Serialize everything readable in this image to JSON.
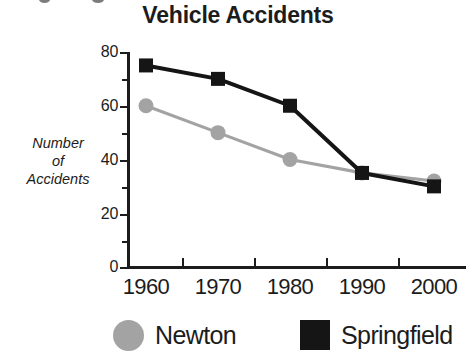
{
  "chart_data": {
    "type": "line",
    "title": "Vehicle Accidents",
    "xlabel": "",
    "ylabel": "Number of Accidents",
    "ylabel_lines": [
      "Number",
      "of",
      "Accidents"
    ],
    "categories": [
      "1960",
      "1970",
      "1980",
      "1990",
      "2000"
    ],
    "x": [
      1960,
      1970,
      1980,
      1990,
      2000
    ],
    "ylim": [
      0,
      80
    ],
    "yticks": [
      0,
      20,
      40,
      60,
      80
    ],
    "yticks_minor": [
      10,
      30,
      50,
      70
    ],
    "grid": false,
    "legend_position": "bottom",
    "series": [
      {
        "name": "Newton",
        "values": [
          60,
          50,
          40,
          35,
          32
        ],
        "color": "#a3a3a3",
        "marker": "circle"
      },
      {
        "name": "Springfield",
        "values": [
          75,
          70,
          60,
          35,
          30
        ],
        "color": "#151515",
        "marker": "square"
      }
    ]
  },
  "legend": {
    "items": [
      {
        "label": "Newton",
        "marker": "legend-circle-icon"
      },
      {
        "label": "Springfield",
        "marker": "legend-square-icon"
      }
    ]
  },
  "axis": {
    "y_tick_labels": [
      "80",
      "60",
      "40",
      "20",
      "0"
    ],
    "x_tick_labels": [
      "1960",
      "1970",
      "1980",
      "1990",
      "2000"
    ]
  }
}
